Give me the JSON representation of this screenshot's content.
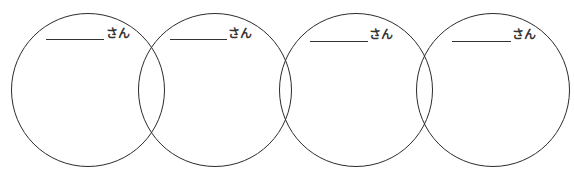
{
  "diagram": {
    "type": "overlapping-circles-worksheet",
    "circle_count": 4,
    "stroke_color": "#2b2b2b",
    "background": "#ffffff",
    "circles": [
      {
        "label_suffix": "さん",
        "name_blank": "",
        "cx": 88,
        "cy": 90,
        "r": 77,
        "line": {
          "x": 46,
          "y": 39,
          "w": 58
        },
        "suffix_pos": {
          "x": 106,
          "y": 28
        }
      },
      {
        "label_suffix": "さん",
        "name_blank": "",
        "cx": 215,
        "cy": 90,
        "r": 77,
        "line": {
          "x": 170,
          "y": 39,
          "w": 57
        },
        "suffix_pos": {
          "x": 228,
          "y": 28
        }
      },
      {
        "label_suffix": "さん",
        "name_blank": "",
        "cx": 356,
        "cy": 90,
        "r": 77,
        "line": {
          "x": 310,
          "y": 41,
          "w": 58
        },
        "suffix_pos": {
          "x": 369,
          "y": 29
        }
      },
      {
        "label_suffix": "さん",
        "name_blank": "",
        "cx": 493,
        "cy": 90,
        "r": 77,
        "line": {
          "x": 452,
          "y": 41,
          "w": 59
        },
        "suffix_pos": {
          "x": 512,
          "y": 29
        }
      }
    ]
  }
}
